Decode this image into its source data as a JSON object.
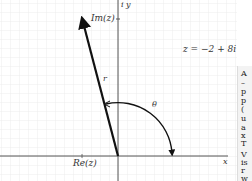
{
  "diagram": {
    "equation": "z = −2 + 8i",
    "labels": {
      "y_axis": "i y",
      "x_axis": "x",
      "imag": "Im(z)",
      "real": "Re(z)",
      "modulus": "r",
      "angle": "θ"
    },
    "point": {
      "re": -2,
      "im": 8
    },
    "colors": {
      "grid": "#e6e6e6",
      "axis": "#555555",
      "vector": "#111111",
      "text": "#333333"
    }
  },
  "side_panel": {
    "lines": [
      "A",
      "–",
      "p",
      "p",
      "(",
      "u",
      "a",
      "x",
      "T",
      "V",
      "is",
      "r",
      "w",
      "a"
    ]
  }
}
